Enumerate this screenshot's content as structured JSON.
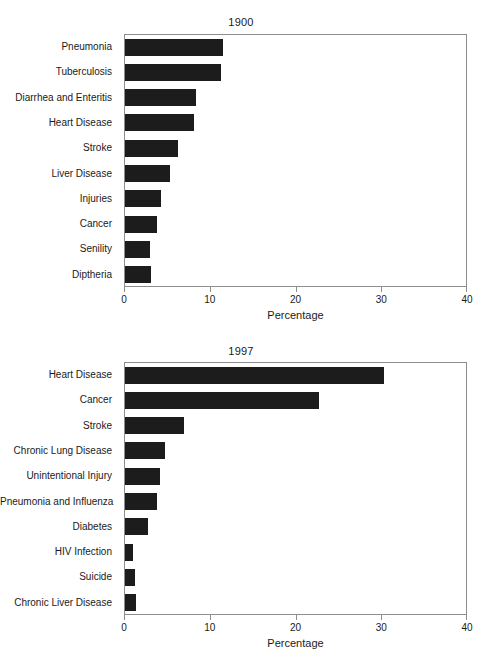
{
  "chart_data": [
    {
      "type": "bar",
      "orientation": "horizontal",
      "title": "1900",
      "xlabel": "Percentage",
      "ylabel": "",
      "xlim": [
        0,
        40
      ],
      "xticks": [
        0,
        10,
        20,
        30,
        40
      ],
      "xtick_labels": [
        "0",
        "10",
        "20",
        "30",
        "40"
      ],
      "grid": false,
      "legend": false,
      "bar_color": "#1c1c1c",
      "frame_color": "#8d8d8d",
      "categories": [
        "Pneumonia",
        "Tuberculosis",
        "Diarrhea and Enteritis",
        "Heart Disease",
        "Stroke",
        "Liver Disease",
        "Injuries",
        "Cancer",
        "Senility",
        "Diptheria"
      ],
      "values": [
        11.4,
        11.2,
        8.3,
        8.0,
        6.2,
        5.2,
        4.2,
        3.7,
        2.9,
        3.0
      ]
    },
    {
      "type": "bar",
      "orientation": "horizontal",
      "title": "1997",
      "xlabel": "Percentage",
      "ylabel": "",
      "xlim": [
        0,
        40
      ],
      "xticks": [
        0,
        10,
        20,
        30,
        40
      ],
      "xtick_labels": [
        "0",
        "10",
        "20",
        "30",
        "40"
      ],
      "grid": false,
      "legend": false,
      "bar_color": "#1c1c1c",
      "frame_color": "#8d8d8d",
      "categories": [
        "Heart Disease",
        "Cancer",
        "Stroke",
        "Chronic Lung Disease",
        "Unintentional Injury",
        "Pneumonia and Influenza",
        "Diabetes",
        "HIV Infection",
        "Suicide",
        "Chronic Liver Disease"
      ],
      "values": [
        30.2,
        22.6,
        6.9,
        4.7,
        4.1,
        3.7,
        2.7,
        0.9,
        1.2,
        1.3
      ]
    }
  ]
}
